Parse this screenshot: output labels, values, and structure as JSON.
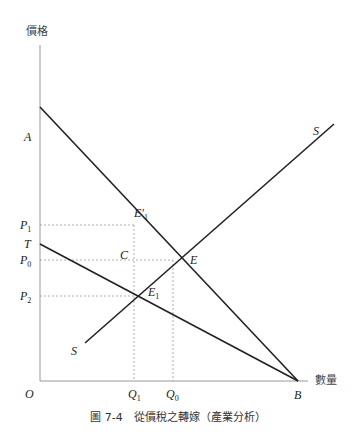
{
  "axes": {
    "y_label": "價格",
    "x_label": "數量",
    "origin": "O"
  },
  "points": {
    "A": "A",
    "B": "B",
    "T": "T",
    "P1": "P",
    "P1_sub": "1",
    "P0": "P",
    "P0_sub": "0",
    "P2": "P",
    "P2_sub": "2",
    "Q1": "Q",
    "Q1_sub": "1",
    "Q0": "Q",
    "Q0_sub": "0",
    "E": "E",
    "E1": "E",
    "E1_sub": "1",
    "E1p": "E′",
    "E1p_sub": "1",
    "C": "C",
    "S_top": "S",
    "S_bottom": "S"
  },
  "lines": [
    {
      "name": "demand AB",
      "from": "A",
      "to": "B"
    },
    {
      "name": "after-tax demand TB",
      "from": "T",
      "to": "B"
    },
    {
      "name": "supply SS"
    }
  ],
  "caption": "圖 7-4　從價稅之轉嫁（產業分析）"
}
